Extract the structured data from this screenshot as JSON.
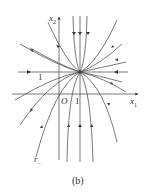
{
  "figure": {
    "caption": "(b)",
    "axes": {
      "x_label": "x",
      "x_sub": "1",
      "y_label": "x",
      "y_sub": "2",
      "origin_label": "O",
      "tick_x": "1",
      "tick_y": "1"
    },
    "curve_label": "r",
    "curve_label_sub": "−",
    "stroke_color": "#444444",
    "node_point": {
      "x": 1,
      "y": 1
    }
  }
}
